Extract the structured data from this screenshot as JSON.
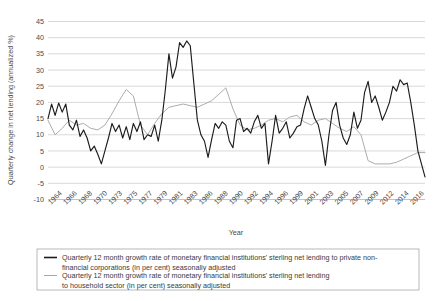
{
  "chart_data": {
    "type": "line",
    "title": "",
    "subtitle": "",
    "xlabel": "Year",
    "ylabel": "Quarterly change in net lending (annualized %)",
    "ylim": [
      -10,
      45
    ],
    "yticks": [
      -10,
      -5,
      0,
      5,
      10,
      15,
      20,
      25,
      30,
      35,
      40,
      45
    ],
    "ytick_labels": [
      "-10",
      "-5",
      "0",
      "5",
      "10",
      "15",
      "20",
      "25",
      "30",
      "35",
      "40",
      "45"
    ],
    "grid": "horizontal",
    "legend_position": "bottom",
    "xtick_labels": [
      "1964",
      "1966",
      "1968",
      "1970",
      "1973",
      "1975",
      "1977",
      "1979",
      "1981",
      "1983",
      "1986",
      "1988",
      "1990",
      "1992",
      "1994",
      "1996",
      "1999",
      "2001",
      "2003",
      "2005",
      "2007",
      "2009",
      "2012",
      "2014",
      "2016"
    ],
    "xlim": [
      1964,
      2017
    ],
    "series": [
      {
        "name": "Quarterly 12 month growth rate of monetary financial institutions' sterling net lending to private non-financial corporations (in per cent) seasonally adjusted",
        "color": "#1c1c1c",
        "x": [
          1964.0,
          1964.5,
          1965.0,
          1965.5,
          1966.0,
          1966.5,
          1967.0,
          1967.5,
          1968.0,
          1968.5,
          1969.0,
          1969.5,
          1970.0,
          1970.5,
          1971.0,
          1971.5,
          1972.0,
          1972.5,
          1973.0,
          1973.5,
          1974.0,
          1974.5,
          1975.0,
          1975.5,
          1976.0,
          1976.5,
          1977.0,
          1977.5,
          1978.0,
          1978.5,
          1979.0,
          1979.5,
          1980.0,
          1980.5,
          1981.0,
          1981.5,
          1982.0,
          1982.5,
          1983.0,
          1983.5,
          1984.0,
          1984.5,
          1985.0,
          1985.5,
          1986.0,
          1986.5,
          1987.0,
          1987.5,
          1988.0,
          1988.5,
          1989.0,
          1989.5,
          1990.0,
          1990.5,
          1991.0,
          1991.5,
          1992.0,
          1992.5,
          1993.0,
          1993.5,
          1994.0,
          1994.5,
          1995.0,
          1995.5,
          1996.0,
          1996.5,
          1997.0,
          1997.5,
          1998.0,
          1998.5,
          1999.0,
          1999.5,
          2000.0,
          2000.5,
          2001.0,
          2001.5,
          2002.0,
          2002.5,
          2003.0,
          2003.5,
          2004.0,
          2004.5,
          2005.0,
          2005.5,
          2006.0,
          2006.5,
          2007.0,
          2007.5,
          2008.0,
          2008.5,
          2009.0,
          2009.5,
          2010.0,
          2010.5,
          2011.0,
          2011.5,
          2012.0,
          2012.5,
          2013.0,
          2013.5,
          2014.0,
          2014.5,
          2015.0,
          2015.5,
          2016.0,
          2016.5,
          2017.0
        ],
        "y": [
          15.0,
          19.5,
          16.0,
          19.8,
          17.0,
          19.5,
          13.0,
          11.5,
          14.5,
          9.5,
          11.5,
          9.0,
          5.0,
          6.5,
          4.0,
          1.0,
          5.0,
          9.0,
          13.5,
          11.0,
          13.0,
          9.0,
          12.5,
          8.5,
          13.5,
          11.0,
          14.0,
          8.5,
          10.0,
          9.5,
          13.0,
          8.0,
          14.5,
          24.0,
          35.0,
          27.5,
          31.0,
          38.5,
          37.0,
          39.0,
          37.5,
          26.0,
          14.5,
          10.0,
          8.0,
          3.0,
          8.5,
          13.5,
          12.0,
          14.0,
          13.0,
          8.0,
          6.0,
          14.5,
          15.0,
          11.0,
          12.0,
          10.5,
          14.0,
          16.0,
          12.0,
          13.5,
          1.0,
          8.0,
          16.0,
          10.5,
          12.0,
          14.0,
          9.0,
          10.5,
          12.5,
          13.0,
          18.0,
          22.0,
          18.5,
          15.0,
          13.0,
          8.0,
          0.5,
          10.0,
          17.5,
          20.0,
          13.0,
          9.0,
          7.0,
          10.0,
          17.0,
          12.0,
          14.5,
          23.0,
          26.5,
          20.0,
          22.0,
          18.5,
          14.5,
          17.0,
          20.0,
          25.0,
          23.5,
          27.0,
          25.5,
          26.0,
          20.0,
          13.0,
          5.0,
          1.0,
          -3.0
        ]
      },
      {
        "name": "Quarterly 12 month growth rate of monetary financial institutions' sterling net lending to household sector (in per cent) seasonally adjusted",
        "color": "#a8a8a8",
        "x": [
          1964.0,
          1965.0,
          1966.0,
          1967.0,
          1968.0,
          1969.0,
          1970.0,
          1971.0,
          1972.0,
          1973.0,
          1974.0,
          1975.0,
          1976.0,
          1977.0,
          1978.0,
          1979.0,
          1980.0,
          1981.0,
          1982.0,
          1983.0,
          1984.0,
          1985.0,
          1986.0,
          1987.0,
          1988.0,
          1989.0,
          1990.0,
          1991.0,
          1992.0,
          1993.0,
          1994.0,
          1995.0,
          1996.0,
          1997.0,
          1998.0,
          1999.0,
          2000.0,
          2001.0,
          2002.0,
          2003.0,
          2004.0,
          2005.0,
          2006.0,
          2007.0,
          2008.0,
          2009.0,
          2010.0,
          2011.0,
          2012.0,
          2013.0,
          2014.0,
          2015.0,
          2016.0,
          2017.0
        ],
        "y": [
          14.5,
          10.0,
          12.0,
          14.5,
          13.0,
          13.5,
          12.0,
          11.5,
          13.0,
          16.5,
          20.5,
          24.0,
          22.0,
          13.0,
          10.0,
          13.5,
          16.5,
          18.5,
          19.0,
          19.5,
          19.0,
          18.5,
          19.5,
          20.5,
          22.5,
          24.5,
          18.0,
          13.0,
          11.5,
          12.0,
          13.0,
          14.5,
          15.0,
          14.0,
          15.5,
          16.0,
          14.0,
          13.0,
          14.5,
          15.0,
          13.5,
          12.0,
          11.0,
          12.5,
          10.0,
          2.0,
          1.0,
          1.0,
          1.0,
          1.5,
          2.5,
          3.5,
          4.5,
          4.5
        ]
      }
    ]
  },
  "legend": {
    "entries": [
      {
        "line1": "Quarterly 12 month growth rate of monetary financial institutions' sterling net lending to private non-",
        "line2": "financial corporations (in per cent) seasonally adjusted",
        "swatch": "solid-black-line"
      },
      {
        "line1": "Quarterly 12 month growth rate of monetary financial institutions' sterling net lending",
        "line2": "to household sector (in per cent) seasonally adjusted",
        "swatch": "solid-grey-line"
      }
    ]
  }
}
